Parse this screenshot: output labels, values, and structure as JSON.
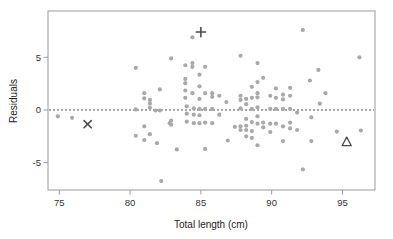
{
  "chart_data": {
    "type": "scatter",
    "title": "",
    "xlabel": "Total length (cm)",
    "ylabel": "Residuals",
    "xlim": [
      74.2,
      97.3
    ],
    "ylim": [
      -7.6,
      9.4
    ],
    "xticks": [
      75,
      80,
      85,
      90,
      95
    ],
    "xtick_labels": [
      "75",
      "80",
      "85",
      "90",
      "95"
    ],
    "yticks": [
      -5,
      0,
      5
    ],
    "ytick_labels": [
      "-5",
      "0",
      "5"
    ],
    "grid": false,
    "legend": "none",
    "reference_line": {
      "orientation": "horizontal",
      "y": 0,
      "style": "dashed",
      "color": "#4a4a4a"
    },
    "point_color": "#a9a9a9",
    "marker_color": "#4a4a4a",
    "series": [
      {
        "name": "residuals",
        "marker": "circle",
        "points": [
          [
            74.9,
            -0.6
          ],
          [
            75.9,
            -0.75
          ],
          [
            80.4,
            4.0
          ],
          [
            80.4,
            0.05
          ],
          [
            80.4,
            -2.45
          ],
          [
            81.0,
            1.6
          ],
          [
            81.0,
            1.1
          ],
          [
            81.0,
            -2.85
          ],
          [
            81.0,
            -1.55
          ],
          [
            81.4,
            0.95
          ],
          [
            81.4,
            0.6
          ],
          [
            81.4,
            0.2
          ],
          [
            81.4,
            -2.3
          ],
          [
            81.8,
            -0.05
          ],
          [
            81.9,
            -3.15
          ],
          [
            82.1,
            -0.05
          ],
          [
            82.1,
            1.95
          ],
          [
            82.2,
            -6.75
          ],
          [
            82.8,
            -1.25
          ],
          [
            82.9,
            4.9
          ],
          [
            82.9,
            -1.0
          ],
          [
            82.9,
            -1.4
          ],
          [
            83.3,
            -3.75
          ],
          [
            83.9,
            4.25
          ],
          [
            83.9,
            2.95
          ],
          [
            83.9,
            2.55
          ],
          [
            83.9,
            1.85
          ],
          [
            83.9,
            1.15
          ],
          [
            84.0,
            0.35
          ],
          [
            84.0,
            -0.35
          ],
          [
            84.0,
            -1.1
          ],
          [
            84.4,
            6.9
          ],
          [
            84.4,
            4.45
          ],
          [
            84.4,
            4.1
          ],
          [
            84.4,
            1.6
          ],
          [
            84.5,
            0.15
          ],
          [
            84.5,
            -0.45
          ],
          [
            84.5,
            -1.25
          ],
          [
            84.9,
            3.35
          ],
          [
            84.9,
            2.25
          ],
          [
            84.9,
            1.05
          ],
          [
            84.9,
            0.1
          ],
          [
            84.9,
            -0.5
          ],
          [
            84.9,
            -1.25
          ],
          [
            85.3,
            4.1
          ],
          [
            85.3,
            1.6
          ],
          [
            85.3,
            0.1
          ],
          [
            85.3,
            -1.2
          ],
          [
            85.3,
            -3.7
          ],
          [
            85.8,
            1.6
          ],
          [
            85.8,
            1.25
          ],
          [
            85.8,
            0.1
          ],
          [
            85.8,
            -1.25
          ],
          [
            86.3,
            1.35
          ],
          [
            86.3,
            -0.45
          ],
          [
            86.8,
            0.75
          ],
          [
            86.9,
            -2.9
          ],
          [
            87.4,
            -1.6
          ],
          [
            87.8,
            5.15
          ],
          [
            87.8,
            1.35
          ],
          [
            87.8,
            0.95
          ],
          [
            87.8,
            0.15
          ],
          [
            87.8,
            -1.55
          ],
          [
            87.8,
            -1.9
          ],
          [
            88.2,
            1.05
          ],
          [
            88.2,
            0.55
          ],
          [
            88.2,
            -0.85
          ],
          [
            88.2,
            -1.5
          ],
          [
            88.2,
            -1.9
          ],
          [
            88.2,
            -2.5
          ],
          [
            88.6,
            2.2
          ],
          [
            88.6,
            1.15
          ],
          [
            88.6,
            0.1
          ],
          [
            88.6,
            -1.15
          ],
          [
            88.6,
            -2.0
          ],
          [
            88.6,
            -2.65
          ],
          [
            89.0,
            4.45
          ],
          [
            89.0,
            2.65
          ],
          [
            89.0,
            1.6
          ],
          [
            89.0,
            1.2
          ],
          [
            89.0,
            0.25
          ],
          [
            89.0,
            -0.6
          ],
          [
            89.0,
            -1.3
          ],
          [
            89.0,
            -3.35
          ],
          [
            89.4,
            3.05
          ],
          [
            89.4,
            -1.2
          ],
          [
            89.4,
            -1.65
          ],
          [
            89.9,
            1.35
          ],
          [
            89.9,
            0.1
          ],
          [
            89.9,
            -1.3
          ],
          [
            89.9,
            -2.1
          ],
          [
            90.3,
            2.05
          ],
          [
            90.3,
            1.15
          ],
          [
            90.3,
            0.1
          ],
          [
            90.3,
            -1.3
          ],
          [
            90.8,
            1.45
          ],
          [
            90.8,
            1.0
          ],
          [
            90.8,
            0.1
          ],
          [
            90.8,
            -1.55
          ],
          [
            90.8,
            -2.95
          ],
          [
            91.3,
            2.1
          ],
          [
            91.3,
            1.35
          ],
          [
            91.3,
            0.1
          ],
          [
            91.3,
            -1.2
          ],
          [
            91.3,
            -1.75
          ],
          [
            91.8,
            -0.25
          ],
          [
            91.8,
            -1.9
          ],
          [
            92.2,
            7.6
          ],
          [
            92.2,
            -5.65
          ],
          [
            92.7,
            2.8
          ],
          [
            92.8,
            -0.7
          ],
          [
            92.8,
            -2.95
          ],
          [
            93.3,
            3.8
          ],
          [
            93.4,
            0.6
          ],
          [
            93.8,
            1.6
          ],
          [
            94.6,
            -2.05
          ],
          [
            96.2,
            5.0
          ],
          [
            96.3,
            -1.95
          ]
        ]
      },
      {
        "name": "highlighted-plus",
        "marker": "plus",
        "points": [
          [
            85.0,
            7.4
          ]
        ]
      },
      {
        "name": "highlighted-cross",
        "marker": "x",
        "points": [
          [
            77.0,
            -1.35
          ]
        ]
      },
      {
        "name": "highlighted-triangle",
        "marker": "triangle",
        "points": [
          [
            95.3,
            -3.05
          ]
        ]
      }
    ]
  }
}
